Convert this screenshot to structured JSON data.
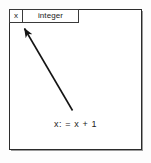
{
  "diagram": {
    "declaration": {
      "variable_name": "x",
      "variable_type": "integer"
    },
    "statement": {
      "text": "x: = x + 1"
    },
    "arrow": {
      "label": "assignment-to-variable-arrow",
      "from": "statement",
      "to": "variable-x-cell",
      "color": "#141414"
    },
    "colors": {
      "frame_border": "#2b2b2b",
      "cell_border": "#3a3a3a",
      "text": "#1a1a1a",
      "background": "#ffffff"
    }
  }
}
